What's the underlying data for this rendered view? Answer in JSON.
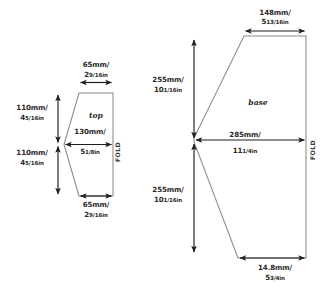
{
  "document": {
    "type": "sewing-pattern-dimension-diagram",
    "background_color": "#ffffff",
    "line_color": "#8a8a8a",
    "dimension_color": "#1e1e1e",
    "text_color": "#2b2b2b"
  },
  "pieces": [
    {
      "id": "top",
      "label": "top",
      "fold_label": "FOLD",
      "dimensions": [
        {
          "id": "top-width",
          "mm": "65mm/",
          "inch": "2",
          "frac": "9/16",
          "unit": "in",
          "orientation": "horizontal",
          "position": "top"
        },
        {
          "id": "upper-left",
          "mm": "110mm/",
          "inch": "4",
          "frac": "5/16",
          "unit": "in",
          "orientation": "vertical",
          "position": "left-upper"
        },
        {
          "id": "mid-width",
          "mm": "130mm/",
          "inch": "5",
          "frac": "1/8",
          "unit": "in",
          "orientation": "horizontal",
          "position": "middle"
        },
        {
          "id": "lower-left",
          "mm": "110mm/",
          "inch": "4",
          "frac": "5/16",
          "unit": "in",
          "orientation": "vertical",
          "position": "left-lower"
        },
        {
          "id": "bottom-width",
          "mm": "65mm/",
          "inch": "2",
          "frac": "9/16",
          "unit": "in",
          "orientation": "horizontal",
          "position": "bottom"
        }
      ]
    },
    {
      "id": "base",
      "label": "base",
      "fold_label": "FOLD",
      "dimensions": [
        {
          "id": "top-width",
          "mm": "148mm/",
          "inch": "5",
          "frac": "13/16",
          "unit": "in",
          "orientation": "horizontal",
          "position": "top"
        },
        {
          "id": "upper-left",
          "mm": "255mm/",
          "inch": "10",
          "frac": "1/16",
          "unit": "in",
          "orientation": "vertical",
          "position": "left-upper"
        },
        {
          "id": "mid-width",
          "mm": "285mm/",
          "inch": "11",
          "frac": "1/4",
          "unit": "in",
          "orientation": "horizontal",
          "position": "middle"
        },
        {
          "id": "lower-left",
          "mm": "255mm/",
          "inch": "10",
          "frac": "1/16",
          "unit": "in",
          "orientation": "vertical",
          "position": "left-lower"
        },
        {
          "id": "bottom-width",
          "mm": "14.8mm/",
          "inch": "5",
          "frac": "3/4",
          "unit": "in",
          "orientation": "horizontal",
          "position": "bottom"
        }
      ]
    }
  ]
}
